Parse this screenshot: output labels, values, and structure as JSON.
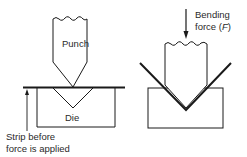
{
  "diagram": {
    "left": {
      "punch_label": "Punch",
      "die_label": "Die",
      "strip_caption_line1": "Strip before",
      "strip_caption_line2": "force is applied"
    },
    "right": {
      "force_label_line1": "Bending",
      "force_label_line2_prefix": "force (",
      "force_symbol": "F",
      "force_label_line2_suffix": ")"
    },
    "colors": {
      "stroke": "#1a1a1a",
      "text": "#2a2a2a",
      "background": "#ffffff"
    }
  }
}
